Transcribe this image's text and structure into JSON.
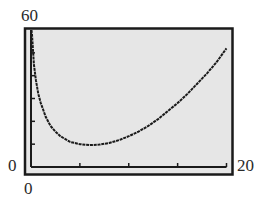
{
  "chart_data": {
    "type": "line",
    "title": "",
    "xlabel": "",
    "ylabel": "",
    "xlim": [
      0,
      20
    ],
    "ylim": [
      0,
      60
    ],
    "x_tick_labels": {
      "min": "0",
      "max": "20"
    },
    "y_tick_labels": {
      "min": "0",
      "max": "60"
    },
    "x_ticks": [
      5,
      10,
      15,
      20
    ],
    "y_ticks": [
      10,
      20,
      30,
      40,
      50
    ],
    "grid": false,
    "legend": null,
    "series": [
      {
        "name": "curve",
        "x": [
          0.1,
          0.3,
          0.5,
          0.75,
          1,
          1.5,
          2,
          2.5,
          3,
          4,
          5,
          6,
          7,
          8,
          9,
          10,
          11,
          12,
          13,
          14,
          15,
          16,
          17,
          18,
          19,
          20
        ],
        "y": [
          58,
          45,
          38,
          32,
          28,
          22,
          18,
          15.5,
          13.5,
          11,
          10,
          9.6,
          9.8,
          10.5,
          11.8,
          13.5,
          15.5,
          18,
          21,
          24.5,
          28,
          32,
          36.5,
          41,
          46,
          52
        ]
      }
    ]
  },
  "labels": {
    "y_max": "60",
    "y_min": "0",
    "x_min": "0",
    "x_max": "20"
  },
  "colors": {
    "plot_background": "#e6e6e6",
    "frame": "#1a1a1a",
    "curve": "#1a1a1a"
  }
}
